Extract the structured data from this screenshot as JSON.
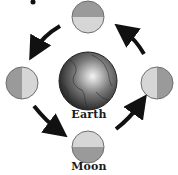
{
  "diagram": {
    "type": "moon-orbit-phases",
    "labels": {
      "earth": "Earth",
      "moon": "Moon"
    },
    "center": {
      "name": "earth",
      "icon": "earth-globe-icon"
    },
    "moons": [
      {
        "position": "top",
        "lit_half": "bottom",
        "icon": "moon-icon"
      },
      {
        "position": "left",
        "lit_half": "right",
        "icon": "moon-icon"
      },
      {
        "position": "bottom",
        "lit_half": "top",
        "icon": "moon-icon"
      },
      {
        "position": "right",
        "lit_half": "left",
        "icon": "moon-icon"
      }
    ],
    "arrows": [
      {
        "from": "top",
        "to": "left",
        "direction": "counter-clockwise"
      },
      {
        "from": "left",
        "to": "bottom",
        "direction": "counter-clockwise"
      },
      {
        "from": "bottom",
        "to": "right",
        "direction": "counter-clockwise"
      },
      {
        "from": "right",
        "to": "top",
        "direction": "counter-clockwise"
      }
    ],
    "colors": {
      "moon_dark": "#9a9a9a",
      "moon_light": "#d6d6d6",
      "moon_outline": "#6e6e6e",
      "earth_dark": "#2e2e2e",
      "earth_mid": "#6f6f6f",
      "earth_highlight": "#f2f2f2",
      "arrow": "#111111"
    }
  }
}
